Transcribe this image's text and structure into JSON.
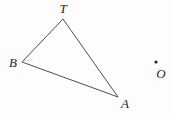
{
  "figure": {
    "width": 171,
    "height": 114,
    "background": "#fdfdfd",
    "line_color": "#4d4d4d",
    "label_color": "#1f1f1f",
    "triangle": {
      "vertices": [
        {
          "id": "T",
          "x": 63,
          "y": 19
        },
        {
          "id": "B",
          "x": 22,
          "y": 62
        },
        {
          "id": "A",
          "x": 118,
          "y": 97
        }
      ],
      "labels": [
        {
          "text": "T",
          "x": 63,
          "y": 13,
          "anchor": "middle"
        },
        {
          "text": "B",
          "x": 13,
          "y": 67,
          "anchor": "middle"
        },
        {
          "text": "A",
          "x": 125,
          "y": 108,
          "anchor": "middle"
        }
      ],
      "angle_mark": {
        "x1": 24,
        "y1": 61,
        "x2": 33,
        "y2": 59.5,
        "color": "#cfcfcf"
      }
    },
    "point": {
      "label": "O",
      "dot": {
        "x": 156,
        "y": 62,
        "r": 1.6
      },
      "label_pos": {
        "x": 161,
        "y": 78
      }
    }
  }
}
